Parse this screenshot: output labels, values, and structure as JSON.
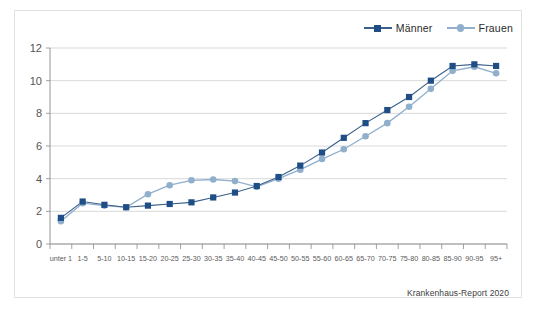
{
  "chart_data": {
    "type": "line",
    "title": "",
    "subtitle": "",
    "xlabel": "",
    "ylabel": "",
    "ylim": [
      0,
      12
    ],
    "yticks": [
      0,
      2,
      4,
      6,
      8,
      10,
      12
    ],
    "grid": true,
    "legend_position": "top-right",
    "categories": [
      "unter 1",
      "1-5",
      "5-10",
      "10-15",
      "15-20",
      "20-25",
      "25-30",
      "30-35",
      "35-40",
      "40-45",
      "45-50",
      "50-55",
      "55-60",
      "60-65",
      "65-70",
      "70-75",
      "75-80",
      "80-85",
      "85-90",
      "90-95",
      "95+"
    ],
    "series": [
      {
        "name": "Männer",
        "color": "#1F4E87",
        "marker": "square",
        "values": [
          1.6,
          2.6,
          2.4,
          2.25,
          2.35,
          2.45,
          2.55,
          2.85,
          3.15,
          3.55,
          4.1,
          4.8,
          5.6,
          6.5,
          7.4,
          8.2,
          9.0,
          10.0,
          10.9,
          11.0,
          10.9
        ]
      },
      {
        "name": "Frauen",
        "color": "#8FAFCC",
        "marker": "circle",
        "values": [
          1.4,
          2.5,
          2.35,
          2.25,
          3.05,
          3.6,
          3.9,
          3.95,
          3.85,
          3.5,
          4.0,
          4.55,
          5.2,
          5.8,
          6.6,
          7.4,
          8.4,
          9.5,
          10.6,
          10.85,
          10.45
        ]
      }
    ]
  },
  "legend": {
    "items": [
      {
        "label": "Männer",
        "marker": "square",
        "color": "#1F4E87"
      },
      {
        "label": "Frauen",
        "marker": "circle",
        "color": "#8FAFCC"
      }
    ]
  },
  "source": {
    "text": "Krankenhaus-Report 2020"
  },
  "colors": {
    "maenner": "#1F4E87",
    "frauen": "#8FAFCC",
    "grid": "#c8c8c8",
    "axis": "#8a8a8a",
    "frame_border": "#e2e2e2",
    "background": "#ffffff"
  }
}
